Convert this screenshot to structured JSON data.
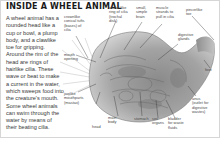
{
  "title": "INSIDE A WHEEL ANIMAL",
  "description": "A wheel animal has a rounded head like a cup or bowl, a plump body, and a clawlike toe for gripping. Around the rim of the head are rings of hairlike cilia. These wave or beat to make a current in the water, which sweeps food into the creature's mouth. Some wheel animals can swim through the water by means of their beating cilia.",
  "labels": {
    "crownlike_tufts": "crownlike\nconical tufts\n(bases) of\ncilia",
    "wheel_ring": "wheel-like\nring of cilia\n(trochal\ndisk)",
    "brain": "small,\nsimple\nbrain",
    "muscle": "muscle\nstrands to\npull in cilia",
    "pincerlike_toe": "pincerlike\ntoe",
    "digestive_glands": "digestive\nglands",
    "mouth_opening": "mouth\nopening",
    "foot": "foot",
    "anus": "anus\n(outlet for\ndigestive\nwastes)",
    "jawlike_mouthparts": "jawlike\nmouthparts\n(mastax)",
    "head": "head",
    "main_body": "main\nbody",
    "stomach": "stomach",
    "sex_organs": "sex\norgans",
    "bladder": "bladder\nfor waste\nfluids"
  },
  "colors": {
    "title": "#1a1a1a",
    "text": "#3a3a3a",
    "label": "#4a4a4a",
    "creature_dark": "#6e6e6e",
    "creature_mid": "#9a9a9a",
    "creature_light": "#c8c8c8",
    "leader_line": "#333333"
  }
}
